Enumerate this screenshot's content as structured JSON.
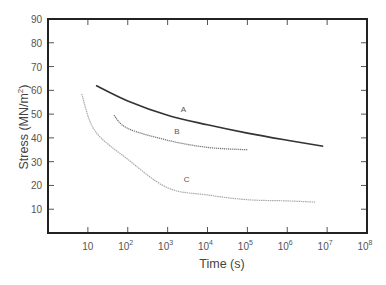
{
  "chart_data": {
    "type": "line",
    "title": "",
    "xlabel": "Time (s)",
    "ylabel": "Stress (MN/m²)",
    "xscale": "log",
    "xlim": [
      1,
      100000000
    ],
    "ylim": [
      0,
      90
    ],
    "grid": false,
    "legend": "inline labels",
    "x_ticks": [
      {
        "value": 10,
        "base": "10",
        "exp": ""
      },
      {
        "value": 100,
        "base": "10",
        "exp": "2"
      },
      {
        "value": 1000,
        "base": "10",
        "exp": "3"
      },
      {
        "value": 10000,
        "base": "10",
        "exp": "4"
      },
      {
        "value": 100000,
        "base": "10",
        "exp": "5"
      },
      {
        "value": 1000000,
        "base": "10",
        "exp": "6"
      },
      {
        "value": 10000000,
        "base": "10",
        "exp": "7"
      },
      {
        "value": 100000000,
        "base": "10",
        "exp": "8"
      }
    ],
    "y_ticks": [
      10,
      20,
      30,
      40,
      50,
      60,
      70,
      80,
      90
    ],
    "series": [
      {
        "name": "A",
        "style": "solid",
        "color": "#333333",
        "x": [
          16,
          100,
          1000,
          10000,
          100000,
          1000000,
          8000000
        ],
        "y": [
          62,
          55.5,
          49.5,
          45.5,
          42,
          39,
          36.5
        ],
        "label_pos": {
          "x": 2500,
          "y": 51
        }
      },
      {
        "name": "B",
        "style": "dotted",
        "color": "#777777",
        "x": [
          45,
          100,
          1000,
          10000,
          100000
        ],
        "y": [
          49.5,
          44,
          39,
          36,
          35
        ],
        "label_pos": {
          "x": 1700,
          "y": 41.5
        }
      },
      {
        "name": "C",
        "style": "dotted-light",
        "color": "#aaaaaa",
        "x": [
          7,
          15,
          100,
          1000,
          10000,
          100000,
          1000000,
          5000000
        ],
        "y": [
          58.5,
          43,
          31,
          19,
          16,
          14,
          13.5,
          13
        ],
        "label_pos": {
          "x": 3000,
          "y": 21.5
        }
      }
    ]
  }
}
